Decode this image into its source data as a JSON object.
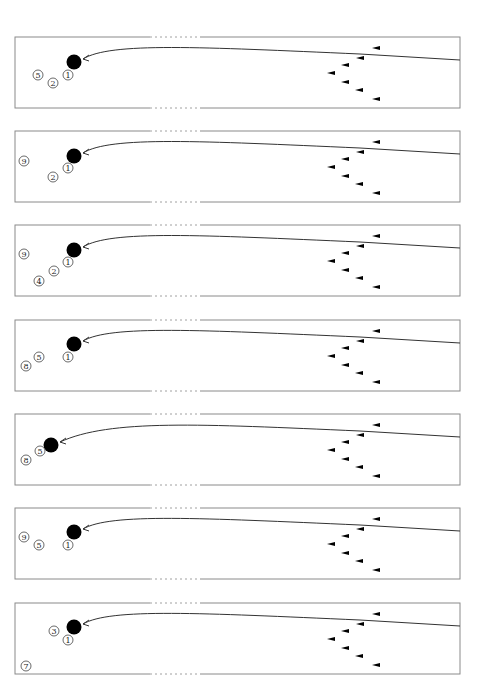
{
  "figure": {
    "width": 488,
    "height": 695,
    "colors": {
      "border": "#8a8a8a",
      "line": "#333333",
      "ball": "#000000",
      "marker": "#000000"
    },
    "lane": {
      "left": 15,
      "right": 460,
      "height": 71,
      "dash_start": 150,
      "dash_end": 200
    },
    "markers": [
      {
        "dx": 377,
        "dy": 11
      },
      {
        "dx": 361,
        "dy": 21
      },
      {
        "dx": 346,
        "dy": 28
      },
      {
        "dx": 332,
        "dy": 36
      },
      {
        "dx": 346,
        "dy": 45
      },
      {
        "dx": 360,
        "dy": 53
      },
      {
        "dx": 377,
        "dy": 62
      }
    ],
    "panels": [
      {
        "id": 1,
        "top": 37,
        "ball": {
          "x": 74,
          "y": 62
        },
        "labels": [
          {
            "text": "5",
            "x": 38,
            "y": 75
          },
          {
            "text": "2",
            "x": 53,
            "y": 83
          },
          {
            "text": "1",
            "x": 68,
            "y": 75
          }
        ]
      },
      {
        "id": 2,
        "top": 131,
        "ball": {
          "x": 74,
          "y": 156
        },
        "labels": [
          {
            "text": "9",
            "x": 24,
            "y": 161
          },
          {
            "text": "2",
            "x": 53,
            "y": 177
          },
          {
            "text": "1",
            "x": 68,
            "y": 168
          }
        ]
      },
      {
        "id": 3,
        "top": 225,
        "ball": {
          "x": 74,
          "y": 250
        },
        "labels": [
          {
            "text": "9",
            "x": 24,
            "y": 254
          },
          {
            "text": "2",
            "x": 54,
            "y": 271
          },
          {
            "text": "1",
            "x": 68,
            "y": 262
          },
          {
            "text": "4",
            "x": 39,
            "y": 281
          }
        ]
      },
      {
        "id": 4,
        "top": 320,
        "ball": {
          "x": 74,
          "y": 344
        },
        "labels": [
          {
            "text": "5",
            "x": 39,
            "y": 357
          },
          {
            "text": "8",
            "x": 26,
            "y": 366
          },
          {
            "text": "1",
            "x": 68,
            "y": 357
          }
        ]
      },
      {
        "id": 5,
        "top": 414,
        "ball": {
          "x": 51,
          "y": 445
        },
        "labels": [
          {
            "text": "5",
            "x": 40,
            "y": 451
          },
          {
            "text": "8",
            "x": 26,
            "y": 460
          }
        ]
      },
      {
        "id": 6,
        "top": 508,
        "ball": {
          "x": 74,
          "y": 532
        },
        "labels": [
          {
            "text": "9",
            "x": 24,
            "y": 537
          },
          {
            "text": "5",
            "x": 39,
            "y": 545
          },
          {
            "text": "1",
            "x": 68,
            "y": 545
          }
        ]
      },
      {
        "id": 7,
        "top": 603,
        "ball": {
          "x": 74,
          "y": 627
        },
        "labels": [
          {
            "text": "3",
            "x": 54,
            "y": 631
          },
          {
            "text": "1",
            "x": 68,
            "y": 640
          },
          {
            "text": "7",
            "x": 26,
            "y": 666
          }
        ]
      }
    ]
  }
}
